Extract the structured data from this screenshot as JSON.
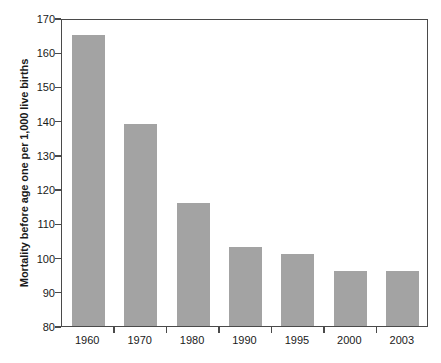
{
  "chart_data": {
    "type": "bar",
    "title": "",
    "xlabel": "",
    "ylabel": "Mortality before age one per 1,000 live births",
    "categories": [
      "1960",
      "1970",
      "1980",
      "1990",
      "1995",
      "2000",
      "2003"
    ],
    "values": [
      165,
      139,
      116,
      103,
      101,
      96,
      96
    ],
    "ylim": [
      80,
      170
    ],
    "yticks": [
      80,
      90,
      100,
      110,
      120,
      130,
      140,
      150,
      160,
      170
    ],
    "ytick_labels": [
      "80",
      "90",
      "100",
      "110",
      "120",
      "130",
      "140",
      "150",
      "160",
      "170"
    ],
    "grid": false,
    "legend": null,
    "legend_position": "none",
    "series": [
      {
        "name": "Mortality before age one per 1,000 live births",
        "values": [
          165,
          139,
          116,
          103,
          101,
          96,
          96
        ]
      }
    ],
    "bar_color": "#a3a3a3",
    "axis_color": "#4a4a4a",
    "text_color": "#1a1a1a",
    "background_color": "#ffffff"
  }
}
